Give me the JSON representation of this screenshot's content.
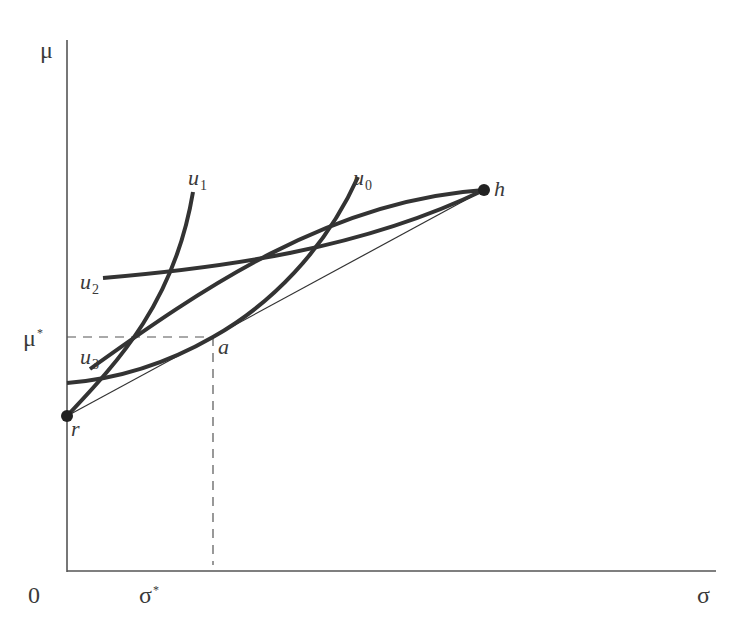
{
  "axes": {
    "y_label": "μ",
    "x_label": "σ",
    "origin_label": "0",
    "y_tick_label": "μ",
    "y_tick_sup": "*",
    "x_tick_label": "σ",
    "x_tick_sup": "*"
  },
  "points": {
    "r": "r",
    "h": "h",
    "a": "a"
  },
  "curves": {
    "u0": {
      "base": "u",
      "sub": "0"
    },
    "u1": {
      "base": "u",
      "sub": "1"
    },
    "u2": {
      "base": "u",
      "sub": "2"
    },
    "u3": {
      "base": "u",
      "sub": "3"
    }
  },
  "colors": {
    "curve": "#333333",
    "axis": "#555555",
    "text": "#3a3a3a"
  }
}
